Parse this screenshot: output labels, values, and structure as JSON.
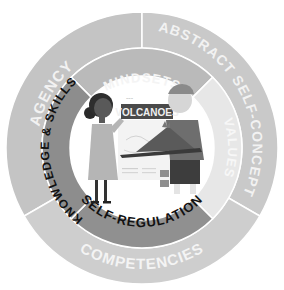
{
  "diagram": {
    "outer_ring": [
      {
        "label": "AGENCY",
        "color": "#c4c4c4",
        "text_color": "#f2f2f2"
      },
      {
        "label": "ABSTRACT SELF-CONCEPT",
        "color": "#c8c8c8",
        "text_color": "#f2f2f2"
      },
      {
        "label": "COMPETENCIES",
        "color": "#cdcdcd",
        "text_color": "#f4f4f4"
      }
    ],
    "middle_ring": [
      {
        "label": "MINDSETS",
        "color": "#b9b9b9",
        "text_color": "#f4f4f4"
      },
      {
        "label": "VALUES",
        "color": "#e6e6e6",
        "text_color": "#f7f7f7"
      },
      {
        "label": "SELF-REGULATION",
        "color": "#8f8f8f",
        "text_color": "#111111"
      },
      {
        "label": "KNOWLEDGE & SKILLS",
        "color": "#8c8c8c",
        "text_color": "#111111"
      }
    ],
    "center": {
      "sign_text": "VOLCANOES",
      "sign_small_text": "~~~",
      "description": "Two students presenting a volcano model"
    }
  }
}
